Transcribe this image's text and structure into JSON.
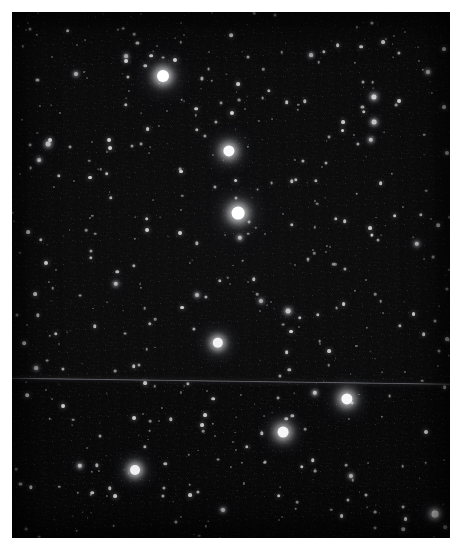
{
  "image": {
    "kind": "astronomical-star-field",
    "title": "Star Field",
    "description": "Digitized photographic sky survey plate showing a dense field of stars on a black background, with a faint horizontal plate seam crossing the lower third.",
    "width": 464,
    "height": 552,
    "margin_color": "#ffffff",
    "sky_color": "#050505",
    "star_color": "#ffffff",
    "seam_color": "#9a9ca2",
    "frame": {
      "left": 12,
      "top": 12,
      "width": 438,
      "height": 526
    }
  },
  "artifacts": {
    "scan_seam": {
      "label": "plate-seam",
      "y_left": 377,
      "y_right": 383,
      "tilt_degrees": 0.78,
      "color": "#9a9ca2"
    }
  },
  "chart_data": {
    "type": "scatter",
    "xlabel": "",
    "ylabel": "",
    "xlim": [
      0,
      438
    ],
    "ylim": [
      0,
      526
    ],
    "grid": false,
    "legend": null,
    "note": "Point sources (stars). x/y are pixel coordinates inside the plate frame; r is apparent radius in pixels; b is relative brightness 0-1.",
    "bright_stars": [
      {
        "x": 151,
        "y": 64,
        "r": 6.0,
        "b": 1.0
      },
      {
        "x": 217,
        "y": 139,
        "r": 5.6,
        "b": 0.98
      },
      {
        "x": 226,
        "y": 201,
        "r": 6.4,
        "b": 1.0
      },
      {
        "x": 206,
        "y": 331,
        "r": 5.2,
        "b": 0.95
      },
      {
        "x": 335,
        "y": 387,
        "r": 5.6,
        "b": 0.97
      },
      {
        "x": 271,
        "y": 420,
        "r": 5.4,
        "b": 0.96
      },
      {
        "x": 123,
        "y": 458,
        "r": 5.0,
        "b": 0.94
      },
      {
        "x": 423,
        "y": 502,
        "r": 3.4,
        "b": 0.88
      }
    ],
    "medium_stars": [
      {
        "x": 362,
        "y": 85,
        "r": 2.6,
        "b": 0.8
      },
      {
        "x": 362,
        "y": 110,
        "r": 2.4,
        "b": 0.76
      },
      {
        "x": 359,
        "y": 128,
        "r": 2.2,
        "b": 0.72
      },
      {
        "x": 228,
        "y": 226,
        "r": 2.2,
        "b": 0.72
      },
      {
        "x": 276,
        "y": 299,
        "r": 2.4,
        "b": 0.76
      },
      {
        "x": 104,
        "y": 272,
        "r": 2.2,
        "b": 0.7
      },
      {
        "x": 36,
        "y": 132,
        "r": 2.4,
        "b": 0.74
      },
      {
        "x": 27,
        "y": 148,
        "r": 2.0,
        "b": 0.68
      },
      {
        "x": 185,
        "y": 283,
        "r": 2.0,
        "b": 0.68
      },
      {
        "x": 303,
        "y": 381,
        "r": 2.2,
        "b": 0.74
      },
      {
        "x": 249,
        "y": 289,
        "r": 2.0,
        "b": 0.66
      },
      {
        "x": 405,
        "y": 232,
        "r": 2.2,
        "b": 0.7
      },
      {
        "x": 68,
        "y": 454,
        "r": 2.2,
        "b": 0.72
      },
      {
        "x": 211,
        "y": 498,
        "r": 2.0,
        "b": 0.68
      },
      {
        "x": 339,
        "y": 464,
        "r": 2.0,
        "b": 0.66
      },
      {
        "x": 64,
        "y": 62,
        "r": 2.0,
        "b": 0.66
      },
      {
        "x": 114,
        "y": 44,
        "r": 1.9,
        "b": 0.64
      },
      {
        "x": 299,
        "y": 43,
        "r": 1.9,
        "b": 0.64
      },
      {
        "x": 416,
        "y": 60,
        "r": 2.0,
        "b": 0.66
      },
      {
        "x": 24,
        "y": 356,
        "r": 1.9,
        "b": 0.62
      }
    ],
    "faint_star_count": 900,
    "faint_star_seed": 20240517
  }
}
